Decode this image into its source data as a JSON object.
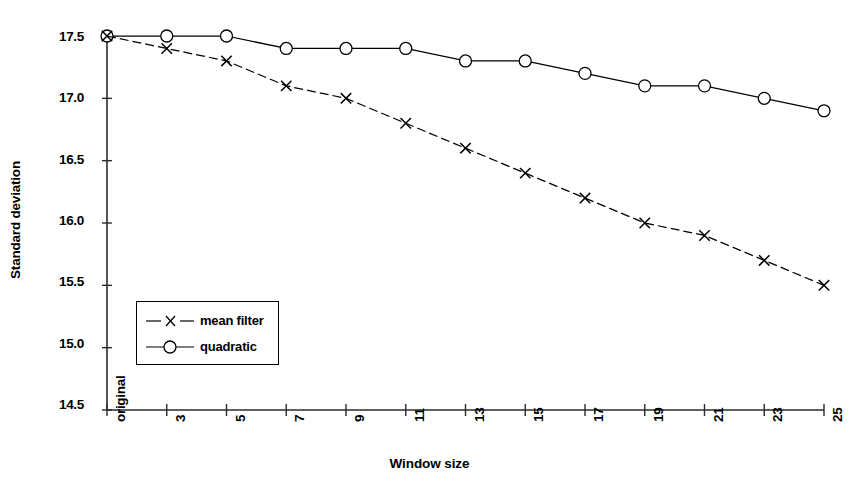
{
  "chart_data": {
    "type": "line",
    "title": "",
    "xlabel": "Window size",
    "ylabel": "Standard deviation",
    "categories": [
      "original",
      "3",
      "5",
      "7",
      "9",
      "11",
      "13",
      "15",
      "17",
      "19",
      "21",
      "23",
      "25"
    ],
    "xtick_labels": [
      "original",
      "3",
      "5",
      "7",
      "9",
      "11",
      "13",
      "15",
      "17",
      "19",
      "21",
      "23",
      "25"
    ],
    "ytick_labels": [
      "17.5",
      "17.0",
      "16.5",
      "16.0",
      "15.5",
      "15.0",
      "14.5"
    ],
    "ytick_values": [
      17.5,
      17.0,
      16.5,
      16.0,
      15.5,
      15.0,
      14.5
    ],
    "ylim": [
      14.5,
      17.5
    ],
    "grid": false,
    "legend_position": "lower-left-inside",
    "series": [
      {
        "name": "mean filter",
        "marker": "x",
        "linestyle": "dashed",
        "color": "#000000",
        "values": [
          17.5,
          17.4,
          17.3,
          17.1,
          17.0,
          16.8,
          16.6,
          16.4,
          16.2,
          16.0,
          15.9,
          15.7,
          15.5
        ]
      },
      {
        "name": "quadratic",
        "marker": "circle",
        "linestyle": "solid",
        "color": "#000000",
        "values": [
          17.5,
          17.5,
          17.5,
          17.4,
          17.4,
          17.4,
          17.3,
          17.3,
          17.2,
          17.1,
          17.1,
          17.0,
          16.9
        ]
      }
    ]
  },
  "legend": {
    "items": [
      {
        "label": "mean filter",
        "marker": "x-marker"
      },
      {
        "label": "quadratic",
        "marker": "circle-marker"
      }
    ]
  },
  "axes": {
    "y_title": "Standard deviation",
    "x_title": "Window size"
  }
}
